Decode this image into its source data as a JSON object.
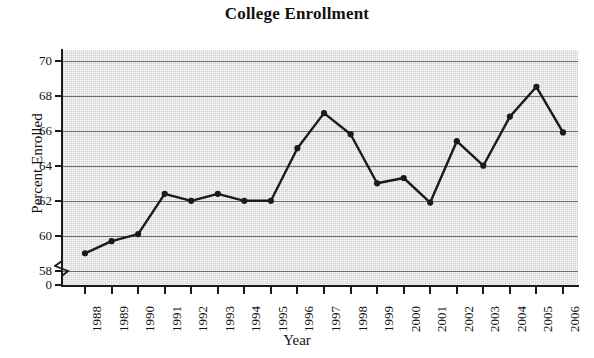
{
  "chart_data": {
    "type": "line",
    "title": "College Enrollment",
    "xlabel": "Year",
    "ylabel": "Percent Enrolled",
    "categories": [
      "1988",
      "1989",
      "1990",
      "1991",
      "1992",
      "1993",
      "1994",
      "1995",
      "1996",
      "1997",
      "1998",
      "1999",
      "2000",
      "2001",
      "2002",
      "2003",
      "2004",
      "2005",
      "2006"
    ],
    "values": [
      59.0,
      59.7,
      60.1,
      62.4,
      62.0,
      62.4,
      62.0,
      62.0,
      65.0,
      67.0,
      65.8,
      63.0,
      63.3,
      61.9,
      65.4,
      64.0,
      66.8,
      68.5,
      65.9
    ],
    "ytick_labels": [
      "70",
      "68",
      "66",
      "64",
      "62",
      "60",
      "58",
      "0"
    ],
    "ytick_values": [
      70,
      68,
      66,
      64,
      62,
      60,
      58,
      0
    ],
    "ylim": [
      57.2,
      70.6
    ],
    "axis_break": true,
    "axis_break_between": [
      "58",
      "0"
    ],
    "grid": "horizontal",
    "legend": "none",
    "marker": "filled-circle",
    "series_color": "#1a1a1a",
    "plot_background_color": "#d2d2d2",
    "gridline_color": "#6e6e6e",
    "page_background_color": "#ffffff"
  }
}
